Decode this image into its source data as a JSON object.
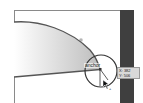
{
  "canvas": {
    "shape": {
      "fill_gradient": [
        "#ffffff",
        "#c8c8c8"
      ],
      "stroke_color": "#555555"
    },
    "artboard_border_color": "#8a8a8a"
  },
  "anchor_indicator": {
    "label": "anchor"
  },
  "cursor": {
    "icon": "pen-add-anchor-cursor"
  },
  "coordinates_tooltip": {
    "x_label": "X: 382",
    "y_label": "Y: 506"
  },
  "side_panel": {
    "color": "#3f3f3f"
  }
}
